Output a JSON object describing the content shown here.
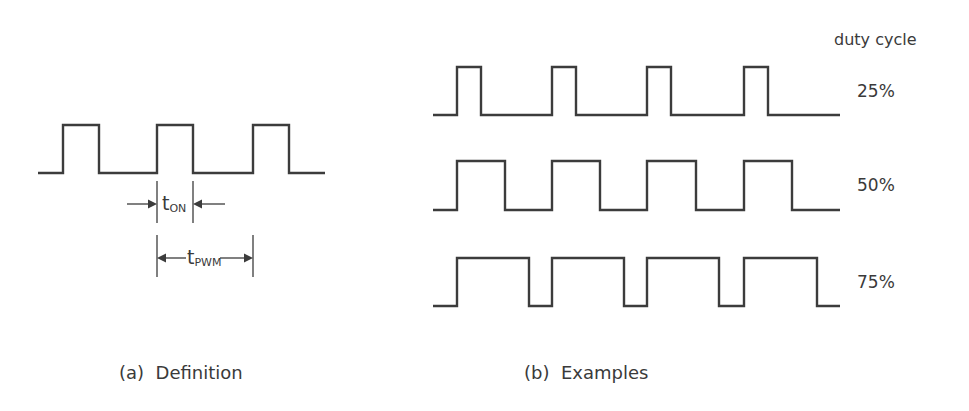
{
  "definition": {
    "caption": "(a)  Definition",
    "t_on": {
      "main": "t",
      "sub": "ON"
    },
    "t_pwm": {
      "main": "t",
      "sub": "PWM"
    },
    "waveform": {
      "x_start": 38,
      "x_end": 325,
      "y_low": 173,
      "y_high": 125,
      "pulses": [
        [
          63,
          99
        ],
        [
          157,
          193
        ],
        [
          253,
          289
        ]
      ]
    }
  },
  "examples": {
    "caption": "(b)  Examples",
    "header": "duty cycle",
    "rows": [
      {
        "label": "25%",
        "duty": 25,
        "y_high": 67,
        "y_low": 115,
        "pulses": [
          [
            457,
            481
          ],
          [
            552,
            576
          ],
          [
            647,
            671
          ],
          [
            744,
            768
          ]
        ]
      },
      {
        "label": "50%",
        "duty": 50,
        "y_high": 161,
        "y_low": 210,
        "pulses": [
          [
            457,
            505
          ],
          [
            552,
            600
          ],
          [
            647,
            696
          ],
          [
            744,
            792
          ]
        ]
      },
      {
        "label": "75%",
        "duty": 75,
        "y_high": 258,
        "y_low": 306,
        "pulses": [
          [
            457,
            529
          ],
          [
            552,
            624
          ],
          [
            647,
            719
          ],
          [
            744,
            817
          ]
        ]
      }
    ],
    "x_start": 433,
    "x_end": 840
  },
  "colors": {
    "line": "#3c3c3c",
    "text": "#3a3a3a",
    "background": "#ffffff"
  }
}
